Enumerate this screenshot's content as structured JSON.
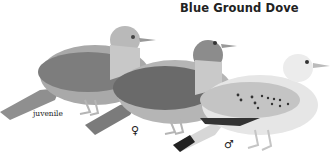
{
  "title": "Blue Ground Dove",
  "figures": [
    {
      "id": "juvenile",
      "label": "juvenile",
      "tone": "#8a8a8a"
    },
    {
      "id": "female",
      "label": "♀",
      "tone": "#767676"
    },
    {
      "id": "male",
      "label": "♂",
      "tone": "#cfcfcf"
    }
  ],
  "colors": {
    "background": "#ffffff",
    "text": "#222222"
  }
}
